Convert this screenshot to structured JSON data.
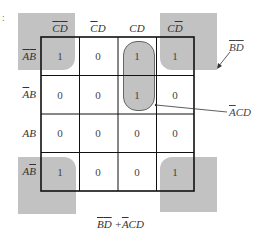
{
  "kmap": {
    "columns": [
      {
        "label_parts": [
          {
            "t": "C",
            "bar": true
          },
          {
            "t": "D",
            "bar": true
          }
        ],
        "text": "C̄D̄"
      },
      {
        "label_parts": [
          {
            "t": "C",
            "bar": true
          },
          {
            "t": "D",
            "bar": false
          }
        ],
        "text": "C̄D"
      },
      {
        "label_parts": [
          {
            "t": "C",
            "bar": false
          },
          {
            "t": "D",
            "bar": false
          }
        ],
        "text": "CD"
      },
      {
        "label_parts": [
          {
            "t": "C",
            "bar": false
          },
          {
            "t": "D",
            "bar": true
          }
        ],
        "text": "CD̄"
      }
    ],
    "rows": [
      {
        "text": "ĀB̄",
        "cells": [
          "1",
          "0",
          "1",
          "1"
        ]
      },
      {
        "text": "ĀB",
        "cells": [
          "0",
          "0",
          "1",
          "0"
        ]
      },
      {
        "text": "AB",
        "cells": [
          "0",
          "0",
          "0",
          "0"
        ]
      },
      {
        "text": "AB̄",
        "cells": [
          "1",
          "0",
          "0",
          "1"
        ]
      }
    ]
  },
  "annotations": {
    "corners_group": "B̄D̄",
    "oval_group": "ĀCD"
  },
  "expression": "B̄D̄ + ĀCD",
  "stray_mark": ":",
  "colors": {
    "shade": "#c2c2c2",
    "grid": "#111111"
  }
}
